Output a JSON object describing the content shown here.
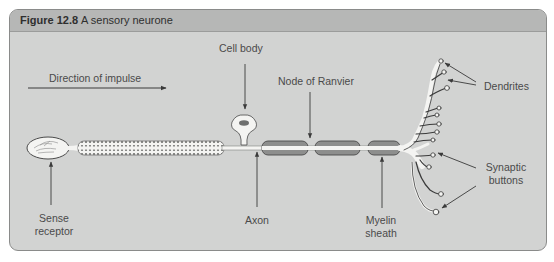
{
  "figure": {
    "number": "Figure 12.8",
    "caption": "A sensory neurone"
  },
  "labels": {
    "direction": "Direction of impulse",
    "cell_body": "Cell body",
    "node_of_ranvier": "Node of Ranvier",
    "dendrites": "Dendrites",
    "sense_receptor_line1": "Sense",
    "sense_receptor_line2": "receptor",
    "axon": "Axon",
    "myelin_line1": "Myelin",
    "myelin_line2": "sheath",
    "synaptic_line1": "Synaptic",
    "synaptic_line2": "buttons"
  },
  "colors": {
    "panel_bg": "#d2d3d2",
    "header_bg": "#b6b7b6",
    "myelin": "#8d8e8d",
    "neurone": "#f4f4f2",
    "arrow": "#3a3a3a"
  }
}
